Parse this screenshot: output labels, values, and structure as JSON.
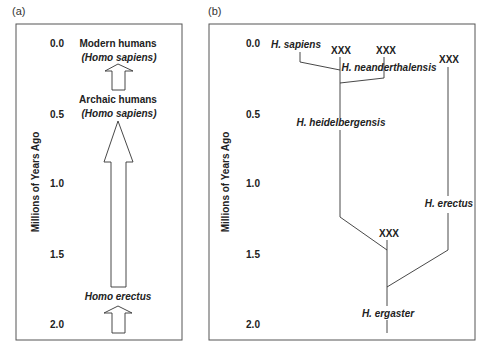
{
  "figure": {
    "panel_a": {
      "tag": "(a)",
      "axis_label": "Millions of Years Ago",
      "ticks": [
        "0.0",
        "0.5",
        "1.0",
        "1.5",
        "2.0"
      ],
      "stages": [
        {
          "name": "Modern humans",
          "species": "Homo sapiens",
          "species_display": "(Homo sapiens)"
        },
        {
          "name": "Archaic humans",
          "species": "Homo sapiens",
          "species_display": "(Homo sapiens)"
        },
        {
          "name": "",
          "species": "Homo erectus",
          "species_display": "Homo erectus"
        }
      ]
    },
    "panel_b": {
      "tag": "(b)",
      "axis_label": "Millions of Years Ago",
      "ticks": [
        "0.0",
        "0.5",
        "1.0",
        "1.5",
        "2.0"
      ],
      "taxa": {
        "sapiens": "H. sapiens",
        "neanderthalensis": "H. neanderthalensis",
        "heidelbergensis": "H. heidelbergensis",
        "erectus": "H. erectus",
        "ergaster": "H. ergaster"
      },
      "extinct_marker": "XXX"
    }
  },
  "colors": {
    "line": "#333333",
    "border": "#555555",
    "text": "#222222"
  }
}
